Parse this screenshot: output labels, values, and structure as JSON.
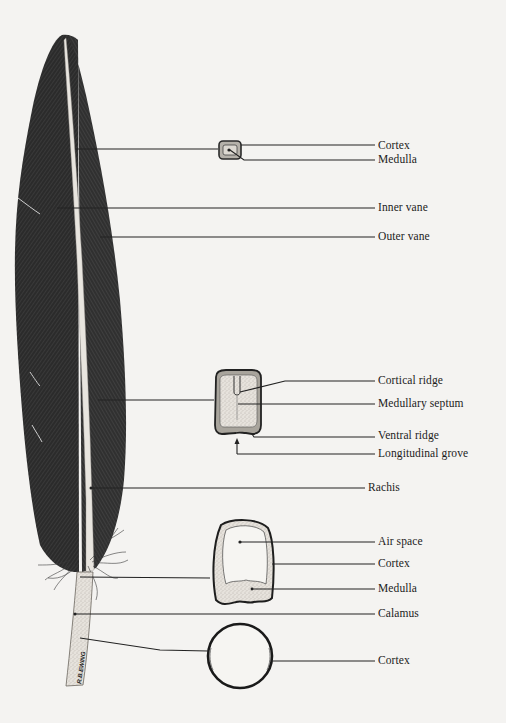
{
  "figure": {
    "signature": "R.B.EWING",
    "colors": {
      "background": "#f4f3f1",
      "ink": "#1c1c1c",
      "vane": "#2e2e2e",
      "shaft": "#e2dfd9",
      "stipple": "#cfcac2"
    }
  },
  "labels": [
    {
      "id": "cortex-distal",
      "text": "Cortex",
      "x": 378,
      "y": 148
    },
    {
      "id": "medulla-distal",
      "text": "Medulla",
      "x": 378,
      "y": 161
    },
    {
      "id": "inner-vane",
      "text": "Inner vane",
      "x": 378,
      "y": 210
    },
    {
      "id": "outer-vane",
      "text": "Outer vane",
      "x": 378,
      "y": 239
    },
    {
      "id": "cortical-ridge",
      "text": "Cortical ridge",
      "x": 378,
      "y": 382
    },
    {
      "id": "medullary-septum",
      "text": "Medullary septum",
      "x": 378,
      "y": 405
    },
    {
      "id": "ventral-ridge",
      "text": "Ventral ridge",
      "x": 378,
      "y": 437
    },
    {
      "id": "longitudinal-grove",
      "text": "Longitudinal grove",
      "x": 378,
      "y": 456
    },
    {
      "id": "rachis",
      "text": "Rachis",
      "x": 368,
      "y": 490
    },
    {
      "id": "air-space",
      "text": "Air space",
      "x": 378,
      "y": 543
    },
    {
      "id": "cortex-proximal",
      "text": "Cortex",
      "x": 378,
      "y": 565
    },
    {
      "id": "medulla-proximal",
      "text": "Medulla",
      "x": 378,
      "y": 590
    },
    {
      "id": "calamus",
      "text": "Calamus",
      "x": 378,
      "y": 616
    },
    {
      "id": "cortex-calamus",
      "text": "Cortex",
      "x": 378,
      "y": 663
    }
  ],
  "cross_sections": [
    {
      "id": "distal-rachis-section",
      "shape": "small rounded square",
      "position": "top"
    },
    {
      "id": "mid-rachis-section",
      "shape": "square with dorsal cortical ridge and medullary septum",
      "position": "middle"
    },
    {
      "id": "proximal-rachis-section",
      "shape": "U-shape with air space over medulla",
      "position": "lower"
    },
    {
      "id": "calamus-section",
      "shape": "circle (hollow tube)",
      "position": "bottom"
    }
  ]
}
